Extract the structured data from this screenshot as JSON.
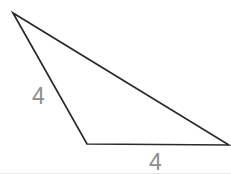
{
  "figure": {
    "type": "geometry-diagram",
    "shape": "triangle",
    "background_color": "#ffffff",
    "stroke_color": "#2a2a2a",
    "stroke_width": 1.7,
    "label_color": "#8d8d8d",
    "canvas": {
      "width": 231,
      "height": 174
    },
    "vertices": [
      {
        "name": "apex",
        "x": 13,
        "y": 13
      },
      {
        "name": "bottom-left",
        "x": 87,
        "y": 144
      },
      {
        "name": "right",
        "x": 229,
        "y": 145
      }
    ],
    "polygon_points": "13,13 87,144 229,145",
    "labels": [
      {
        "name": "left-side",
        "text": "4",
        "x": 32,
        "y": 85
      },
      {
        "name": "bottom-side",
        "text": "4",
        "x": 149,
        "y": 151
      }
    ]
  }
}
